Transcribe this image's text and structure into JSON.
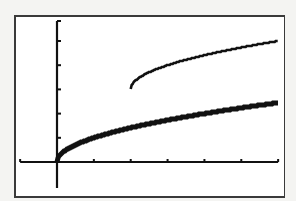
{
  "chart_data": {
    "type": "line",
    "title": "",
    "xlabel": "",
    "ylabel": "",
    "xlim": [
      -1,
      6
    ],
    "ylim": [
      -1,
      5.8
    ],
    "xscl": 1,
    "yscl": 1,
    "grid": false,
    "legend": null,
    "series": [
      {
        "name": "y = sqrt(x)",
        "style": "thick",
        "x": [
          0,
          0.25,
          0.5,
          1,
          1.5,
          2,
          2.5,
          3,
          3.5,
          4,
          4.5,
          5,
          5.5,
          6
        ],
        "values": [
          0,
          0.5,
          0.71,
          1,
          1.22,
          1.41,
          1.58,
          1.73,
          1.87,
          2,
          2.12,
          2.24,
          2.35,
          2.45
        ]
      },
      {
        "name": "y = sqrt(x - 2) + 3",
        "style": "thin",
        "x": [
          2,
          2.25,
          2.5,
          3,
          3.5,
          4,
          4.5,
          5,
          5.5,
          6
        ],
        "values": [
          3,
          3.5,
          3.71,
          4,
          4.22,
          4.41,
          4.58,
          4.73,
          4.87,
          5
        ]
      }
    ]
  },
  "screen": {
    "label": "Graphing calculator screen"
  }
}
